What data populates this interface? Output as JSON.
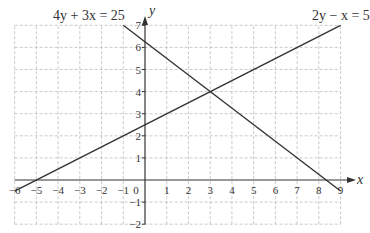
{
  "chart_data": {
    "type": "line",
    "title": "",
    "xlabel": "x",
    "ylabel": "y",
    "xlim": [
      -6,
      9
    ],
    "ylim": [
      -2,
      7
    ],
    "grid": true,
    "grid_style": "dashed",
    "x_ticks": [
      -6,
      -5,
      -4,
      -3,
      -2,
      -1,
      0,
      1,
      2,
      3,
      4,
      5,
      6,
      7,
      8,
      9
    ],
    "y_ticks": [
      -2,
      -1,
      1,
      2,
      3,
      4,
      5,
      6,
      7
    ],
    "series": [
      {
        "name": "4y + 3x = 25",
        "equation": "4y + 3x = 25",
        "x": [
          -1,
          9
        ],
        "y": [
          7,
          -0.5
        ],
        "label_position": "top-left"
      },
      {
        "name": "2y − x = 5",
        "equation": "2y − x = 5",
        "x": [
          -6,
          9
        ],
        "y": [
          -0.5,
          7
        ],
        "label_position": "top-right"
      }
    ],
    "intersection": {
      "x": 3,
      "y": 4
    },
    "annotations": [
      "4y + 3x = 25",
      "2y − x = 5"
    ]
  },
  "labels": {
    "x_axis": "x",
    "y_axis": "y",
    "origin": "0",
    "line1": "4y + 3x = 25",
    "line2": "2y − x = 5"
  },
  "colors": {
    "line": "#333333",
    "grid": "#bdbdbd",
    "axis": "#333333"
  }
}
